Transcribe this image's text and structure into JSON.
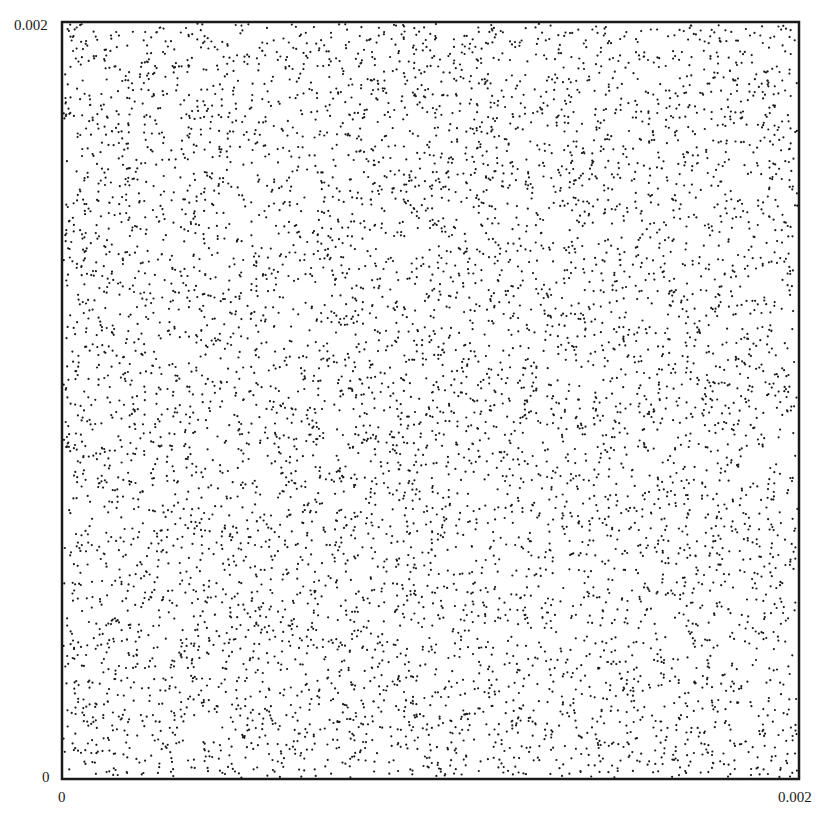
{
  "chart_data": {
    "type": "scatter",
    "title": "",
    "xlabel": "",
    "ylabel": "",
    "xlim": [
      0,
      0.002
    ],
    "ylim": [
      0,
      0.002
    ],
    "x_ticks": [
      "0",
      "0.002"
    ],
    "y_ticks": [
      "0",
      "0.002"
    ],
    "grid": false,
    "legend": null,
    "marker_color": "#1a1a1a",
    "marker_size_px": 2.2,
    "point_count_estimate": 7000,
    "distribution": "approximately uniform random over the full square [0,0.002] x [0,0.002]",
    "series": [
      {
        "name": "points",
        "description": "~7000 uniformly scattered points (random seed generated)",
        "seed": 20240611,
        "count": 7000
      }
    ]
  },
  "axes": {
    "y_top_label": "0.002",
    "y_bottom_label": "0",
    "x_left_label": "0",
    "x_right_label": "0.002"
  },
  "frame": {
    "left": 62,
    "top": 22,
    "right": 799,
    "bottom": 779,
    "stroke": "#1a1a1a",
    "stroke_width": 2.5
  }
}
